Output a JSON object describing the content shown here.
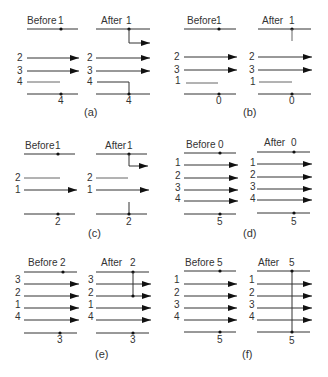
{
  "figure": {
    "panels": [
      {
        "id": "a",
        "caption": "(a)",
        "before": {
          "title": "Before",
          "top_label": "1",
          "bottom_label": "4",
          "row_labels": [
            "2",
            "3",
            "4"
          ]
        },
        "after": {
          "title": "After",
          "top_label": "1",
          "bottom_label": "4",
          "row_labels": [
            "2",
            "3",
            "4"
          ]
        }
      },
      {
        "id": "b",
        "caption": "(b)",
        "before": {
          "title": "Before",
          "top_label": "1",
          "bottom_label": "0",
          "row_labels": [
            "2",
            "3",
            "1"
          ]
        },
        "after": {
          "title": "After",
          "top_label": "1",
          "bottom_label": "0",
          "row_labels": [
            "2",
            "3",
            "1"
          ]
        }
      },
      {
        "id": "c",
        "caption": "(c)",
        "before": {
          "title": "Before",
          "top_label": "1",
          "bottom_label": "2",
          "row_labels": [
            "2",
            "1"
          ]
        },
        "after": {
          "title": "After",
          "top_label": "1",
          "bottom_label": "2",
          "row_labels": [
            "2",
            "1"
          ]
        }
      },
      {
        "id": "d",
        "caption": "(d)",
        "before": {
          "title": "Before",
          "top_label": "0",
          "bottom_label": "5",
          "row_labels": [
            "1",
            "2",
            "3",
            "4"
          ]
        },
        "after": {
          "title": "After",
          "top_label": "0",
          "bottom_label": "5",
          "row_labels": [
            "1",
            "2",
            "3",
            "4"
          ]
        }
      },
      {
        "id": "e",
        "caption": "(e)",
        "before": {
          "title": "Before",
          "top_label": "2",
          "bottom_label": "3",
          "row_labels": [
            "3",
            "2",
            "1",
            "4"
          ]
        },
        "after": {
          "title": "After",
          "top_label": "2",
          "bottom_label": "3",
          "row_labels": [
            "3",
            "2",
            "1",
            "4"
          ]
        }
      },
      {
        "id": "f",
        "caption": "(f)",
        "before": {
          "title": "Before",
          "top_label": "5",
          "bottom_label": "5",
          "row_labels": [
            "1",
            "2",
            "3",
            "4"
          ]
        },
        "after": {
          "title": "After",
          "top_label": "5",
          "bottom_label": "5",
          "row_labels": [
            "1",
            "2",
            "3",
            "4"
          ]
        }
      }
    ]
  }
}
